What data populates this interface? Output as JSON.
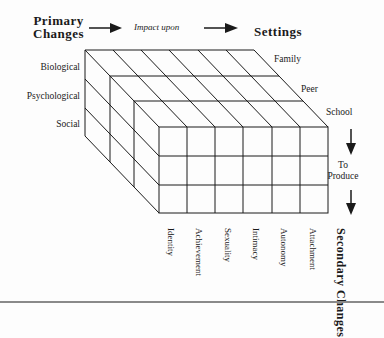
{
  "header": {
    "primary_line1": "Primary",
    "primary_line2": "Changes",
    "impact": "Impact upon",
    "settings": "Settings"
  },
  "primary_changes": [
    "Biological",
    "Psychological",
    "Social"
  ],
  "settings": [
    "Family",
    "Peer",
    "School"
  ],
  "to_produce": {
    "line1": "To",
    "line2": "Produce"
  },
  "secondary_changes": {
    "title_line1": "Secondary",
    "title_line2": "Changes",
    "items": [
      "Identity",
      "Achievement",
      "Sexuality",
      "Intimacy",
      "Autonomy",
      "Attachment"
    ]
  },
  "colors": {
    "line": "#1a1a1a",
    "rule": "#8a8a8a"
  }
}
